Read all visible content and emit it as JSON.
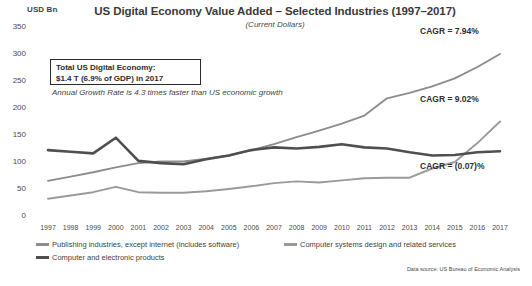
{
  "chart_data": {
    "type": "line",
    "title": "US Digital Economy Value Added – Selected Industries (1997–2017)",
    "subtitle": "(Current Dollars)",
    "ylabel": "USD Bn",
    "xlabel": "",
    "ylim": [
      0,
      350
    ],
    "yticks": [
      0,
      50,
      100,
      150,
      200,
      250,
      300,
      350
    ],
    "grid": false,
    "legend_position": "bottom",
    "categories": [
      1997,
      1998,
      1999,
      2000,
      2001,
      2002,
      2003,
      2004,
      2005,
      2006,
      2007,
      2008,
      2009,
      2010,
      2011,
      2012,
      2013,
      2014,
      2015,
      2016,
      2017
    ],
    "series": [
      {
        "name": "Publishing industries, except internet (includes software)",
        "color": "#8c8c8c",
        "cagr_label": "CAGR = 7.94%",
        "values": [
          65,
          73,
          81,
          90,
          98,
          101,
          101,
          106,
          112,
          122,
          133,
          146,
          158,
          171,
          186,
          218,
          228,
          240,
          255,
          276,
          300
        ]
      },
      {
        "name": "Computer systems design and related services",
        "color": "#9a9a9a",
        "cagr_label": "CAGR = 9.02%",
        "values": [
          32,
          38,
          44,
          54,
          44,
          43,
          43,
          46,
          50,
          55,
          61,
          64,
          62,
          66,
          70,
          71,
          71,
          88,
          100,
          135,
          175
        ]
      },
      {
        "name": "Computer and electronic products",
        "color": "#4f4f4f",
        "cagr_label": "CAGR = (0.07)%",
        "values": [
          122,
          119,
          116,
          145,
          102,
          98,
          96,
          105,
          112,
          122,
          127,
          125,
          128,
          133,
          127,
          125,
          118,
          112,
          113,
          118,
          120
        ]
      }
    ],
    "annotations": {
      "callout_line1": "Total US Digital Economy:",
      "callout_line2": "$1.4 T (6.9% of GDP) in 2017",
      "growth_note": "Annual Growth Rate is 4.3 times faster than US economic growth"
    },
    "source": "Data source: US Bureau of Economic Analysis"
  }
}
